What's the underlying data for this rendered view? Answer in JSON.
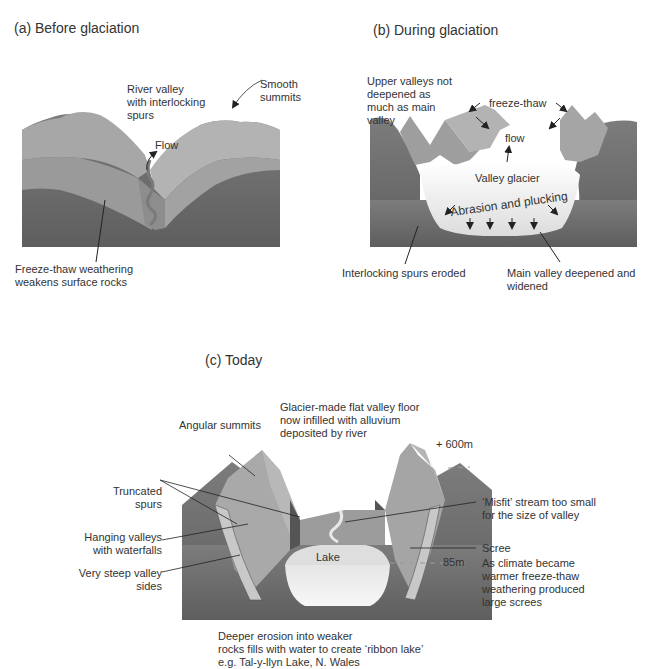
{
  "panels": {
    "a": {
      "title": "(a) Before glaciation",
      "labels": {
        "river_valley": [
          "River valley",
          "with interlocking",
          "spurs"
        ],
        "smooth_summits": [
          "Smooth",
          "summits"
        ],
        "flow": "Flow",
        "freeze_thaw": [
          "Freeze-thaw weathering",
          "weakens surface rocks"
        ]
      }
    },
    "b": {
      "title": "(b) During glaciation",
      "labels": {
        "upper_valleys": [
          "Upper valleys not",
          "deepened as",
          "much as main",
          "valley"
        ],
        "freeze_thaw": "freeze-thaw",
        "flow": "flow",
        "valley_glacier": "Valley glacier",
        "abrasion": "Abrasion and plucking",
        "spurs_eroded": "Interlocking spurs eroded",
        "main_valley": [
          "Main valley deepened and",
          "widened"
        ]
      }
    },
    "c": {
      "title": "(c) Today",
      "labels": {
        "angular_summits": "Angular summits",
        "valley_floor": [
          "Glacier-made flat valley floor",
          "now infilled with alluvium",
          "deposited by river"
        ],
        "height_top": "+ 600m",
        "truncated_spurs": [
          "Truncated",
          "spurs"
        ],
        "hanging_valleys": [
          "Hanging valleys",
          "with waterfalls"
        ],
        "steep_sides": [
          "Very steep valley",
          "sides"
        ],
        "lake": "Lake",
        "height_lake": "85m",
        "misfit": [
          "‘Misfit’ stream too small",
          "for the size of valley"
        ],
        "scree": "Scree",
        "scree_note": [
          "As climate became",
          "warmer freeze-thaw",
          "weathering produced",
          "large screes"
        ],
        "ribbon_lake": [
          "Deeper erosion into weaker",
          "rocks fills with water to create ‘ribbon lake’",
          "e.g. Tal-y-llyn Lake, N. Wales"
        ]
      }
    }
  },
  "colors": {
    "rock_dark": "#6e6e6e",
    "rock_mid": "#8c8c8c",
    "slope_light": "#a8a8a8",
    "slope_lighter": "#bdbdbd",
    "ice": "#f2f2f2",
    "lake": "#d8d8d8",
    "text": "#333333",
    "line": "#222222"
  }
}
